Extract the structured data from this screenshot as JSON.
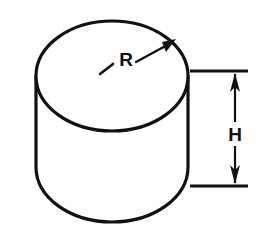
{
  "figure": {
    "kind": "engineering-drawing",
    "background_color": "#ffffff",
    "line_color": "#111111",
    "labels": {
      "radius": "R",
      "height": "H"
    },
    "geometry": {
      "top_ellipse": {
        "center_x": 112,
        "center_y": 76,
        "radius_x": 76,
        "radius_y": 55
      },
      "body": {
        "left_x": 36,
        "right_x": 188,
        "top_y": 76,
        "bottom_y": 167,
        "bottom_arc_radius_y": 55
      },
      "radius_leader": {
        "dash_start_x": 100,
        "dash_start_y": 73,
        "dash_end_x": 112,
        "dash_end_y": 65,
        "arrow_start_x": 136,
        "arrow_start_y": 62,
        "arrow_tip_x": 175,
        "arrow_tip_y": 40
      },
      "height_dimension": {
        "extension_top_y": 71,
        "extension_bottom_y": 186,
        "extension_left_x": 190,
        "extension_right_x": 248,
        "dimension_line_x": 235,
        "label_x": 235,
        "label_y": 134
      }
    }
  }
}
